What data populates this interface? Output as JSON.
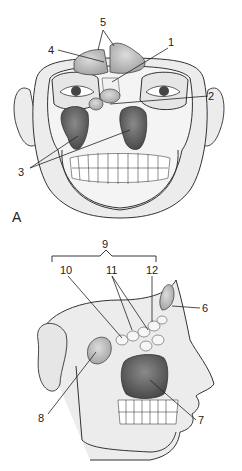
{
  "figure": {
    "panels": [
      {
        "id": "A",
        "label": "A",
        "view": "frontal"
      },
      {
        "id": "B",
        "label": "",
        "view": "lateral"
      }
    ],
    "frontal_labels": [
      {
        "num": "1"
      },
      {
        "num": "2"
      },
      {
        "num": "3"
      },
      {
        "num": "4"
      },
      {
        "num": "5"
      }
    ],
    "lateral_labels": [
      {
        "num": "6"
      },
      {
        "num": "7"
      },
      {
        "num": "8"
      },
      {
        "num": "9"
      },
      {
        "num": "10"
      },
      {
        "num": "11"
      },
      {
        "num": "12"
      }
    ],
    "colors": {
      "line": "#2a2a2a",
      "skin": "#e9e9e9",
      "bone": "#f4f4f4",
      "sinus_dark": "#5a5a5a",
      "sinus_light": "#b9b9b9"
    }
  }
}
